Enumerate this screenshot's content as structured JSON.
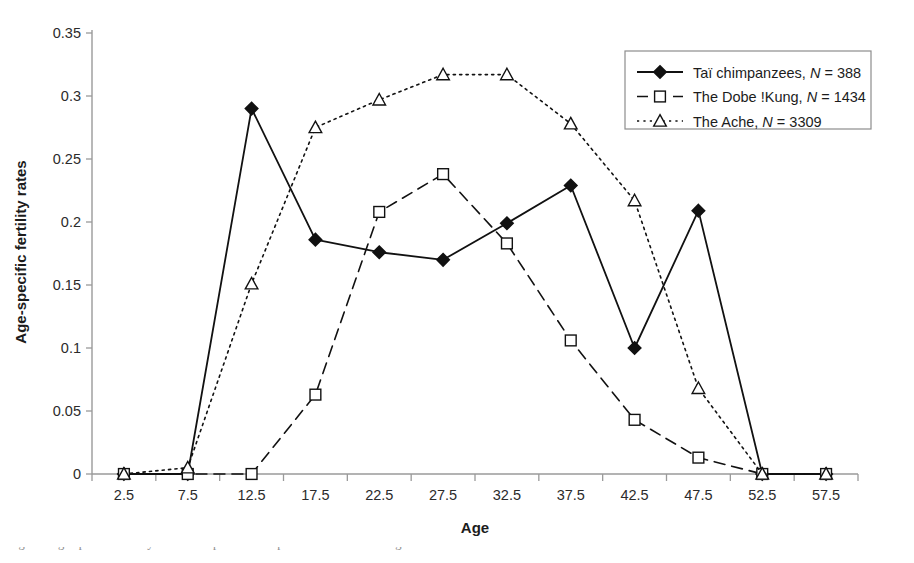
{
  "figure": {
    "caption": "Fig. 3.2   Age-specific fertility in Taï chimpanzees compared to the Dobe !Kung and the Ache"
  },
  "chart_data": {
    "type": "line",
    "title": "",
    "xlabel": "Age",
    "ylabel": "Age-specific fertility rates",
    "categories": [
      "2.5",
      "7.5",
      "12.5",
      "17.5",
      "22.5",
      "27.5",
      "32.5",
      "37.5",
      "42.5",
      "47.5",
      "52.5",
      "57.5"
    ],
    "ylim": [
      0,
      0.35
    ],
    "yticks": [
      "0",
      "0.05",
      "0.1",
      "0.15",
      "0.2",
      "0.25",
      "0.3",
      "0.35"
    ],
    "ytick_values": [
      0,
      0.05,
      0.1,
      0.15,
      0.2,
      0.25,
      0.3,
      0.35
    ],
    "grid": false,
    "legend_position": "top-right",
    "series": [
      {
        "name": "Taï chimpanzees",
        "label_prefix": "Taï chimpanzees, ",
        "n_symbol": "N",
        "n_equals": " = ",
        "n_value": "388",
        "marker": "filled-diamond",
        "line_style": "solid",
        "color": "#111111",
        "values": [
          0,
          0,
          0.29,
          0.186,
          0.176,
          0.17,
          0.199,
          0.229,
          0.1,
          0.209,
          0,
          0
        ]
      },
      {
        "name": "The Dobe !Kung",
        "label_prefix": "The Dobe !Kung, ",
        "n_symbol": "N",
        "n_equals": " = ",
        "n_value": "1434",
        "marker": "open-square",
        "line_style": "dashed",
        "color": "#111111",
        "values": [
          0,
          0,
          0,
          0.063,
          0.208,
          0.238,
          0.183,
          0.106,
          0.043,
          0.013,
          0,
          0
        ]
      },
      {
        "name": "The Ache",
        "label_prefix": "The Ache, ",
        "n_symbol": "N",
        "n_equals": " = ",
        "n_value": "3309",
        "marker": "open-triangle",
        "line_style": "dotted",
        "color": "#111111",
        "values": [
          0,
          0.005,
          0.151,
          0.275,
          0.297,
          0.317,
          0.317,
          0.278,
          0.217,
          0.068,
          0,
          0
        ]
      }
    ]
  }
}
